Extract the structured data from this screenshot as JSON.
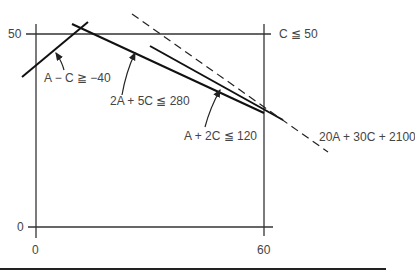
{
  "axes": {
    "y_ticks": [
      {
        "label": "50",
        "value": 50
      },
      {
        "label": "0",
        "value": 0
      }
    ],
    "x_ticks": [
      {
        "label": "0",
        "value": 0
      },
      {
        "label": "60",
        "value": 60
      }
    ]
  },
  "constraints": {
    "c_max": "C ≦ 50",
    "a_minus_c": "A − C ≧ −40",
    "two_a_five_c": "2A + 5C ≦ 280",
    "a_two_c": "A + 2C ≦ 120",
    "objective": "20A + 30C + 2100"
  }
}
